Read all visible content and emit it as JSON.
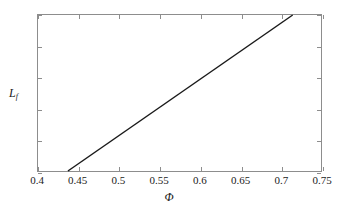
{
  "chart_data": {
    "type": "line",
    "title": "",
    "subtitle": "",
    "xlabel": "Φ",
    "ylabel": "L",
    "ylabel_subscript": "f",
    "xlim": [
      0.4,
      0.75
    ],
    "ylim": [
      0,
      1
    ],
    "xticks": [
      0.4,
      0.45,
      0.5,
      0.55,
      0.6,
      0.65,
      0.7,
      0.75
    ],
    "xticklabels": [
      "0.4",
      "0.45",
      "0.5",
      "0.55",
      "0.6",
      "0.65",
      "0.7",
      "0.75"
    ],
    "yticks": [
      0,
      0.2,
      0.4,
      0.6,
      0.8,
      1
    ],
    "yticklabels": [
      "0",
      "0.2",
      "0.4",
      "0.6",
      "0.8",
      "1"
    ],
    "grid": false,
    "legend": null,
    "tick_direction": "in",
    "box": true,
    "series": [
      {
        "name": "Lf vs Phi",
        "color": "#1a1a1a",
        "linewidth": 1.5,
        "x": [
          0.437,
          0.715
        ],
        "values": [
          0,
          1
        ]
      }
    ],
    "annotations": []
  },
  "figure": {
    "background": "#ffffff",
    "axis_color": "#8d8d8d",
    "text_color": "#1a1a1a"
  }
}
